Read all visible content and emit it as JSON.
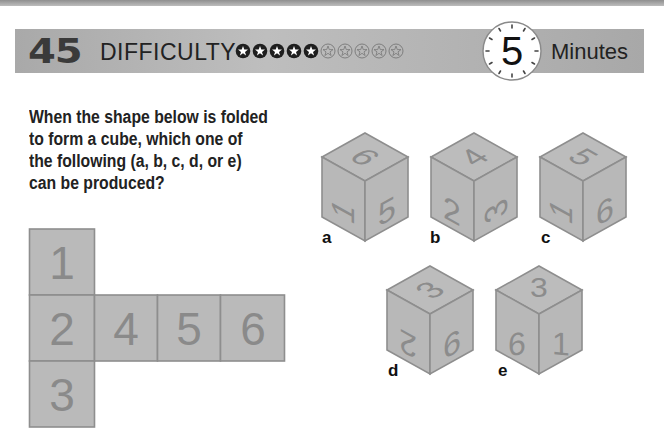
{
  "header": {
    "puzzle_number": "45",
    "difficulty_label": "DIFFICULTY",
    "difficulty_filled": 5,
    "difficulty_total": 10,
    "time_value": "5",
    "time_unit": "Minutes"
  },
  "question": {
    "lines": [
      "When the shape below is folded",
      "to form a cube, which one of",
      "the following (a, b, c, d, or e)",
      "can be produced?"
    ]
  },
  "net": {
    "squares": [
      {
        "label": "1",
        "col": 0,
        "row": 0
      },
      {
        "label": "2",
        "col": 0,
        "row": 1
      },
      {
        "label": "3",
        "col": 0,
        "row": 2
      },
      {
        "label": "4",
        "col": 1,
        "row": 1
      },
      {
        "label": "5",
        "col": 2,
        "row": 1
      },
      {
        "label": "6",
        "col": 3,
        "row": 1
      }
    ]
  },
  "options": [
    {
      "label": "a",
      "top": "9",
      "left": "1",
      "right": "5"
    },
    {
      "label": "b",
      "top": "4",
      "left": "2",
      "right": "3"
    },
    {
      "label": "c",
      "top": "5",
      "left": "1",
      "right": "6"
    },
    {
      "label": "d",
      "top": "3",
      "left": "2",
      "right": "9"
    },
    {
      "label": "e",
      "top": "3",
      "left": "6",
      "right": "1"
    }
  ],
  "colors": {
    "face": "#b9b9b9",
    "edge": "#8e8e8e",
    "digit": "#8a8a8a",
    "header_bar": "#b3b3b3"
  }
}
